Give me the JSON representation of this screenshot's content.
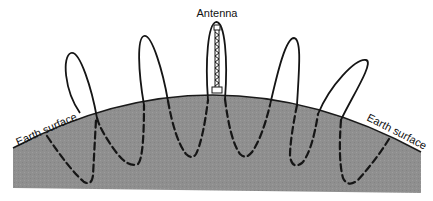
{
  "diagram": {
    "labels": {
      "antenna": "Antenna",
      "earth_surface_left": "Earth surface",
      "earth_surface_right": "Earth surface"
    },
    "colors": {
      "ground": "#8e8e8e",
      "line": "#151515",
      "background": "#ffffff",
      "surface_line": "#1a1a1a"
    },
    "elements": {
      "ground": "curved earth segment (shaded)",
      "antenna": "lattice tower on surface at center",
      "sky_wave_loops": 5,
      "ground_wave_segments": "dashed, below surface"
    }
  }
}
